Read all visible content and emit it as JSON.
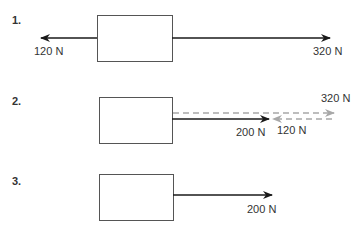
{
  "diagrams": [
    {
      "number": "1.",
      "forces": [
        {
          "label": "120 N",
          "direction": "left",
          "value": 120,
          "style": "solid"
        },
        {
          "label": "320 N",
          "direction": "right",
          "value": 320,
          "style": "solid"
        }
      ]
    },
    {
      "number": "2.",
      "forces": [
        {
          "label": "320 N",
          "direction": "right",
          "value": 320,
          "style": "dashed"
        },
        {
          "label": "120 N",
          "direction": "left",
          "value": 120,
          "style": "dashed"
        },
        {
          "label": "200 N",
          "direction": "right",
          "value": 200,
          "style": "solid",
          "role": "resultant"
        }
      ]
    },
    {
      "number": "3.",
      "forces": [
        {
          "label": "200 N",
          "direction": "right",
          "value": 200,
          "style": "solid",
          "role": "resultant"
        }
      ]
    }
  ],
  "colors": {
    "solid_arrow": "#1a1a1a",
    "dashed_arrow": "#a8a8a8",
    "box_border": "#555555"
  }
}
